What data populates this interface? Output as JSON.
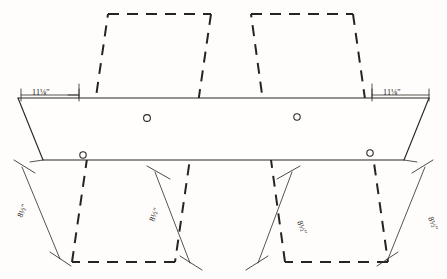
{
  "drawing": {
    "title": "Plywood seat blank layout",
    "description": "Orthographic layout showing a solid horizontal band with bevelled ends overlaid by two dashed parallelogram panels, four mounting holes and six dimension callouts.",
    "colors": {
      "paper": "#fffdfb",
      "solid_stroke": "#2a2724",
      "dashed_stroke": "#262321",
      "dimension_stroke": "#3a3632",
      "text": "#1d1b19"
    },
    "units": "inches"
  },
  "dimensions": [
    {
      "id": "top-left-width",
      "value": "11⅛″",
      "orientation": "horizontal",
      "location": "top-left"
    },
    {
      "id": "top-right-width",
      "value": "11⅛″",
      "orientation": "horizontal",
      "location": "top-right"
    },
    {
      "id": "left-outer-height",
      "value": "8½″",
      "orientation": "diagonal",
      "location": "bottom-far-left"
    },
    {
      "id": "left-inner-height",
      "value": "8½″",
      "orientation": "diagonal",
      "location": "bottom-left-inner"
    },
    {
      "id": "right-inner-height",
      "value": "8½″",
      "orientation": "diagonal",
      "location": "bottom-right-inner"
    },
    {
      "id": "right-outer-height",
      "value": "8½″",
      "orientation": "diagonal",
      "location": "bottom-far-right"
    }
  ],
  "holes": [
    {
      "id": "hole-upper-left",
      "cx": 147,
      "cy": 118,
      "r": 3.4
    },
    {
      "id": "hole-lower-left",
      "cx": 83,
      "cy": 155,
      "r": 3.2
    },
    {
      "id": "hole-upper-right",
      "cx": 297,
      "cy": 117,
      "r": 3.2
    },
    {
      "id": "hole-lower-right",
      "cx": 370,
      "cy": 153,
      "r": 3.2
    }
  ],
  "shapes": {
    "band": {
      "type": "trapezoid-band",
      "style": "solid",
      "points": "18,98 429,98 404,160 43,160"
    },
    "panel_left": {
      "type": "parallelogram",
      "style": "dashed",
      "points": "108,14 211,14 175,262 72,262"
    },
    "panel_right": {
      "type": "parallelogram",
      "style": "dashed",
      "points": "251,14 353,14 388,262 285,262"
    }
  }
}
